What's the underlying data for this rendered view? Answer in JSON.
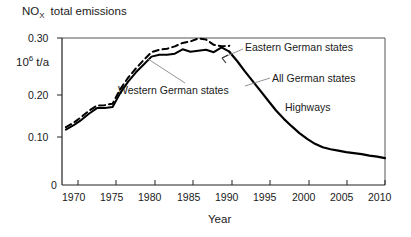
{
  "figure": {
    "width": 411,
    "height": 237,
    "background": "#ffffff",
    "line_color": "#000000"
  },
  "chart_data": {
    "type": "line",
    "title": "NO",
    "title_subscript": "X",
    "title_rest": "total emissions",
    "ylabel_mantissa": "10",
    "ylabel_exponent": "6",
    "ylabel_unit": "t/a",
    "xlabel": "Year",
    "xlim": [
      1968.5,
      2010
    ],
    "ylim": [
      0,
      0.315
    ],
    "grid": false,
    "legend_position": "inline-annotations",
    "xticks": [
      1970,
      1975,
      1980,
      1985,
      1990,
      1995,
      2000,
      2005,
      2010
    ],
    "xticklabels": [
      "1970",
      "1975",
      "1980",
      "1985",
      "1990",
      "1995",
      "2000",
      "2005",
      "2010"
    ],
    "yticks": [
      0,
      0.1,
      0.2,
      0.3
    ],
    "yticklabels": [
      "0",
      "0.10",
      "0.20",
      "0.30"
    ],
    "annotations": [
      {
        "text": "Eastern German states",
        "x": 245,
        "y": 47
      },
      {
        "text": "All German states",
        "x": 272,
        "y": 78
      },
      {
        "text": "Western German states",
        "x": 118,
        "y": 90
      },
      {
        "text": "Highways",
        "x": 285,
        "y": 107
      }
    ],
    "series": [
      {
        "name": "Eastern German states",
        "style": "dashed",
        "x": [
          1969,
          1970,
          1971,
          1972,
          1973,
          1974,
          1975,
          1976,
          1977,
          1978,
          1979,
          1980,
          1981,
          1982,
          1983,
          1984,
          1985,
          1986,
          1987,
          1988,
          1989,
          1990
        ],
        "values": [
          0.118,
          0.127,
          0.139,
          0.152,
          0.162,
          0.163,
          0.166,
          0.196,
          0.219,
          0.238,
          0.255,
          0.271,
          0.276,
          0.278,
          0.283,
          0.29,
          0.293,
          0.299,
          0.297,
          0.286,
          0.283,
          0.284
        ]
      },
      {
        "name": "Western German states",
        "style": "solid",
        "x": [
          1969,
          1970,
          1971,
          1972,
          1973,
          1974,
          1975,
          1976,
          1977,
          1978,
          1979,
          1980,
          1981,
          1982,
          1983,
          1984,
          1985,
          1986,
          1987,
          1988,
          1989,
          1990
        ],
        "values": [
          0.113,
          0.122,
          0.133,
          0.146,
          0.157,
          0.157,
          0.159,
          0.188,
          0.211,
          0.23,
          0.246,
          0.262,
          0.266,
          0.266,
          0.268,
          0.277,
          0.272,
          0.274,
          0.276,
          0.271,
          0.281,
          0.272
        ]
      },
      {
        "name": "All German states",
        "style": "solid",
        "x": [
          1990,
          1991,
          1992,
          1993,
          1994,
          1995,
          1996,
          1997,
          1998,
          1999,
          2000,
          2001,
          2002,
          2003,
          2004,
          2005,
          2006,
          2007,
          2008,
          2009,
          2010
        ],
        "values": [
          0.272,
          0.253,
          0.232,
          0.212,
          0.192,
          0.172,
          0.152,
          0.135,
          0.12,
          0.106,
          0.094,
          0.084,
          0.077,
          0.073,
          0.07,
          0.067,
          0.065,
          0.063,
          0.06,
          0.058,
          0.055
        ]
      }
    ]
  }
}
